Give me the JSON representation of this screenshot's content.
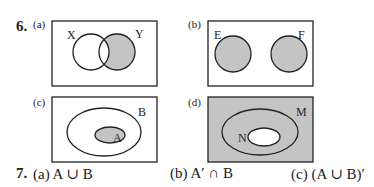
{
  "question6": {
    "number": "6.",
    "colors": {
      "shade": "#c4c4c4",
      "stroke": "#222222",
      "background": "#ffffff"
    },
    "diagrams": [
      {
        "label": "(a)",
        "sets": [
          "X",
          "Y"
        ],
        "description": "Two overlapping circles X and Y; Y minus X is shaded"
      },
      {
        "label": "(b)",
        "sets": [
          "E",
          "F"
        ],
        "description": "Two disjoint circles E and F; both shaded"
      },
      {
        "label": "(c)",
        "sets": [
          "A",
          "B"
        ],
        "description": "Ellipse A inside ellipse B; A shaded"
      },
      {
        "label": "(d)",
        "sets": [
          "N",
          "M"
        ],
        "description": "Ellipse N inside ellipse M; outside M and inside N unshaded... universe outside M shaded, region between N and M unshaded, N unshaded"
      }
    ]
  },
  "question7": {
    "number": "7.",
    "parts": [
      {
        "label": "(a)",
        "expression": "A ∪ B"
      },
      {
        "label": "(b)",
        "expression": "A′ ∩ B"
      },
      {
        "label": "(c)",
        "expression": "(A ∪ B)′"
      }
    ]
  }
}
